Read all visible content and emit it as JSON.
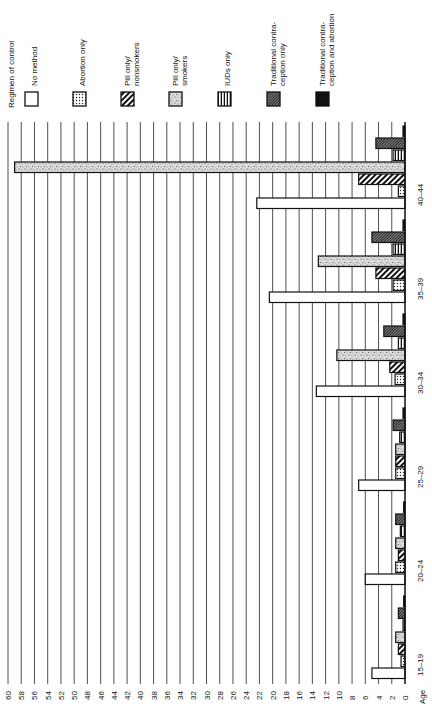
{
  "chart_data": {
    "type": "bar",
    "orientation": "horizontal-rotated",
    "title": "",
    "legend_title": "Regimen of control",
    "xlabel": "Age",
    "ylabel": "",
    "categories": [
      "15–19",
      "20–24",
      "25–29",
      "30–34",
      "35–39",
      "40–44"
    ],
    "value_ticks": [
      0,
      2,
      4,
      6,
      8,
      10,
      12,
      14,
      16,
      18,
      20,
      22,
      24,
      26,
      28,
      30,
      32,
      34,
      36,
      38,
      40,
      42,
      44,
      46,
      48,
      50,
      52,
      54,
      56,
      58,
      60
    ],
    "ylim": [
      0,
      60
    ],
    "grid": true,
    "legend_position": "top",
    "series": [
      {
        "name": "No method",
        "pattern": "white",
        "values": [
          5,
          6,
          7,
          13.4,
          20.5,
          22.4
        ]
      },
      {
        "name": "Abortion only",
        "pattern": "dots",
        "values": [
          0.6,
          1.4,
          1.4,
          1.5,
          1.8,
          1.0
        ]
      },
      {
        "name": "Pill only/ nonsmokers",
        "pattern": "diagonal-hatch",
        "values": [
          1.0,
          1.0,
          1.4,
          2.3,
          4.4,
          7.0
        ]
      },
      {
        "name": "Pill only/ smokers",
        "pattern": "speckle",
        "values": [
          1.4,
          1.4,
          1.4,
          10.3,
          13.1,
          59.0
        ]
      },
      {
        "name": "IUDs only",
        "pattern": "horizontal-stripes",
        "values": [
          0.3,
          0.7,
          0.8,
          1.0,
          1.8,
          1.8
        ]
      },
      {
        "name": "Traditional contra- ception only",
        "pattern": "fine-crosshatch",
        "values": [
          1.0,
          1.4,
          1.8,
          3.2,
          5.0,
          4.4
        ]
      },
      {
        "name": "Traditional contra- ception and abortion",
        "pattern": "solid-black",
        "values": [
          0.2,
          0.2,
          0.3,
          0.3,
          0.3,
          0.3
        ]
      }
    ]
  },
  "legend": {
    "title": "Regimen of control",
    "items": [
      {
        "line1": "No method",
        "line2": ""
      },
      {
        "line1": "Abortion only",
        "line2": ""
      },
      {
        "line1": "Pill only/",
        "line2": "nonsmokers"
      },
      {
        "line1": "Pill only/",
        "line2": "smokers"
      },
      {
        "line1": "IUDs only",
        "line2": ""
      },
      {
        "line1": "Traditional contra-",
        "line2": "ception only"
      },
      {
        "line1": "Traditional contra-",
        "line2": "ception and abortion"
      }
    ]
  },
  "axis": {
    "age_label": "Age"
  }
}
